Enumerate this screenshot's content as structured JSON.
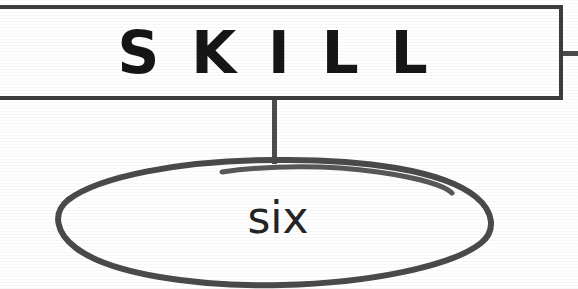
{
  "diagram": {
    "type": "concept-map",
    "title_node": {
      "label": "SKILL",
      "shape": "rectangle",
      "clipped_left": true
    },
    "child_node": {
      "label": "six",
      "shape": "ellipse",
      "style": "hand-drawn"
    },
    "connectors": [
      {
        "name": "skill-to-six",
        "orientation": "vertical",
        "from": "SKILL",
        "to": "six"
      },
      {
        "name": "skill-right-stub",
        "orientation": "horizontal",
        "from": "SKILL",
        "to": ""
      }
    ],
    "colors": {
      "node_border": "#3d3d3d",
      "ellipse_stroke": "#4a4a4a",
      "connector": "#4d4d4d",
      "text": "#161616",
      "background": "#ffffff"
    }
  }
}
